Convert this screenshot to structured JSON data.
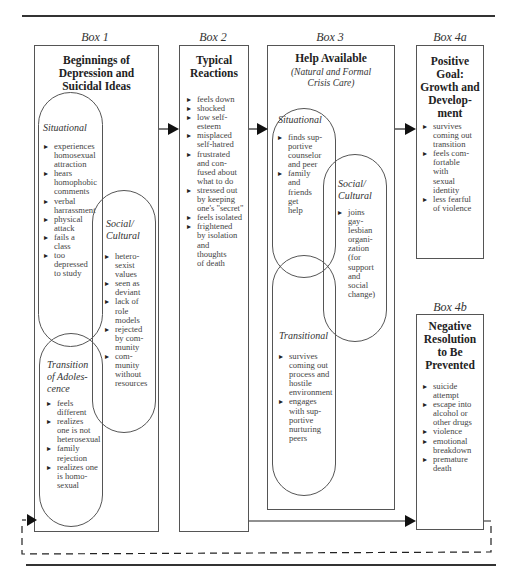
{
  "box1": {
    "label": "Box 1",
    "title": "Beginnings of\nDepression and\nSuicidal Ideas",
    "situational": {
      "heading": "Situational",
      "items": [
        "experiences\nhomosexual\nattraction",
        "hears\nhomophobic\ncomments",
        "verbal\nharrassment",
        "physical\nattack",
        "fails a\nclass",
        "too\ndepressed\nto study"
      ]
    },
    "social_cultural": {
      "heading": "Social/\nCultural",
      "items": [
        "hetero-\nsexist\nvalues",
        "seen as\ndeviant",
        "lack of\nrole\nmodels",
        "rejected\nby com-\nmunity",
        "com-\nmunity\nwithout\nresources"
      ]
    },
    "transition": {
      "heading": "Transition\nof Adoles-\ncence",
      "items": [
        "feels\ndifferent",
        "realizes\none is not\nheterosexual",
        "family\nrejection",
        "realizes one\nis homo-\nsexual"
      ]
    }
  },
  "box2": {
    "label": "Box 2",
    "title": "Typical\nReactions",
    "items": [
      "feels down",
      "shocked",
      "low self-\nesteem",
      "misplaced\nself-hatred",
      "frustrated\nand con-\nfused about\nwhat to do",
      "stressed out\nby keeping\none's \"secret\"",
      "feels isolated",
      "frightened\nby isolation\nand\nthoughts\nof death"
    ]
  },
  "box3": {
    "label": "Box 3",
    "title": "Help Available",
    "subtitle": "(Natural and Formal\nCrisis Care)",
    "situational": {
      "heading": "Situational",
      "items": [
        "finds sup-\nportive\ncounselor\nand peer",
        "family\nand\nfriends\nget\nhelp"
      ]
    },
    "social_cultural": {
      "heading": "Social/\nCultural",
      "items": [
        "joins\ngay-\nlesbian\norgani-\nzation\n(for\nsupport\nand\nsocial\nchange)"
      ]
    },
    "transitional": {
      "heading": "Transitional",
      "items": [
        "survives\ncoming out\nprocess and\nhostile\nenvironment",
        "engages\nwith sup-\nportive\nnurturing\npeers"
      ]
    }
  },
  "box4a": {
    "label": "Box 4a",
    "title": "Positive\nGoal:\nGrowth and\nDevelop-\nment",
    "items": [
      "survives\ncoming out\ntransition",
      "feels com-\nfortable\nwith\nsexual\nidentity",
      "less fearful\nof violence"
    ]
  },
  "box4b": {
    "label": "Box 4b",
    "title": "Negative\nResolution\nto Be\nPrevented",
    "items": [
      "suicide\nattempt",
      "escape into\nalcohol or\nother drugs",
      "violence",
      "emotional\nbreakdown",
      "premature\ndeath"
    ]
  }
}
